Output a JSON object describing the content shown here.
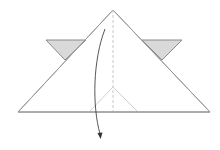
{
  "diagram": {
    "type": "origami-fold-step",
    "colors": {
      "background": "#ffffff",
      "outline": "#9a9a9a",
      "flap_fill": "#d9d9d9",
      "flap_stroke": "#8a8a8a",
      "center_dashed": "#c8c8c8",
      "inner_crease": "#cfcfcf",
      "arrow": "#444444"
    },
    "shapes": {
      "main_triangle": {
        "apex": [
          113,
          10
        ],
        "base_left": [
          18,
          112
        ],
        "base_right": [
          210,
          112
        ]
      },
      "left_flap": {
        "points": [
          [
            46,
            40
          ],
          [
            86,
            40
          ],
          [
            65,
            60
          ]
        ]
      },
      "right_flap": {
        "points": [
          [
            142,
            40
          ],
          [
            182,
            40
          ],
          [
            162,
            60
          ]
        ]
      },
      "center_line": {
        "from": [
          113,
          10
        ],
        "to": [
          113,
          112
        ],
        "style": "dashed"
      },
      "inner_chevron": {
        "apex": [
          113,
          87
        ],
        "left": [
          90,
          111
        ],
        "right": [
          137,
          111
        ]
      },
      "fold_arrow": {
        "from": [
          105,
          29
        ],
        "to": [
          100,
          138
        ],
        "direction": "down"
      }
    }
  }
}
